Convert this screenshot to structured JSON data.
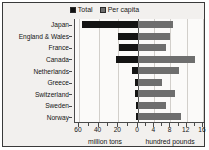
{
  "chart_data": {
    "type": "bar",
    "orientation": "horizontal",
    "style": "bidirectional-paired",
    "title": "",
    "categories": [
      "Japan",
      "England & Wales",
      "France",
      "Canada",
      "Netherlands",
      "Greece",
      "Switzerland",
      "Sweden",
      "Norway"
    ],
    "series": [
      {
        "name": "Total",
        "unit": "million tons",
        "direction": "left",
        "color": "#141414",
        "axis_label": "million tons",
        "ticks": [
          60,
          40,
          20,
          0
        ],
        "axis_range": [
          64,
          0
        ],
        "values": [
          57,
          20,
          19,
          22,
          6,
          3,
          3,
          2,
          2
        ]
      },
      {
        "name": "Per capita",
        "unit": "hundred pounds",
        "direction": "right",
        "color": "#6e6e6e",
        "axis_label": "hundred pounds",
        "ticks": [
          0,
          4,
          8,
          12,
          16
        ],
        "axis_range": [
          0,
          16.5
        ],
        "values": [
          8.5,
          8.0,
          7.0,
          14.0,
          10.0,
          6.0,
          9.0,
          7.0,
          10.5
        ]
      }
    ],
    "grid": true,
    "legend_position": "top-center",
    "xlabel_left": "million tons",
    "xlabel_right": "hundred pounds"
  },
  "legend": {
    "items": [
      {
        "label": "Total",
        "color": "#141414",
        "swatch": "legend-swatch-total"
      },
      {
        "label": "Per capita",
        "color": "#6e6e6e",
        "swatch": "legend-swatch-per-capita"
      }
    ]
  },
  "axis": {
    "left_ticks": [
      "60",
      "40",
      "20"
    ],
    "zero_tick": "0",
    "right_ticks": [
      "4",
      "8",
      "12",
      "16"
    ],
    "left_title": "million tons",
    "right_title": "hundred pounds"
  }
}
